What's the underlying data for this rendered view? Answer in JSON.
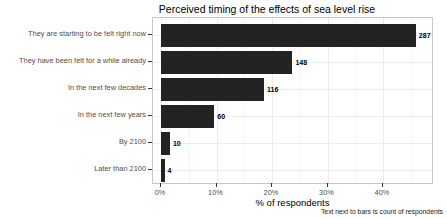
{
  "chart_data": {
    "type": "bar",
    "orientation": "horizontal",
    "title": "Perceived timing of the effects of sea level rise",
    "categories": [
      "They are starting to be felt right now",
      "They have been felt for a while already",
      "In the next few decades",
      "In the next few years",
      "By 2100",
      "Later than 2100"
    ],
    "counts": [
      287,
      148,
      116,
      60,
      10,
      4
    ],
    "values_pct": [
      45.9,
      23.7,
      18.6,
      9.6,
      1.6,
      0.6
    ],
    "total_respondents": 625,
    "xlabel": "% of respondents",
    "ylabel": "",
    "caption": "Text next to bars is count of respondents",
    "x_tick_labels": [
      "0%",
      "10%",
      "20%",
      "30%",
      "40%"
    ],
    "x_tick_values": [
      0,
      10,
      20,
      30,
      40
    ],
    "x_minor_tick_values": [
      5,
      15,
      25,
      35,
      45
    ],
    "xlim": [
      0,
      49
    ],
    "legend": "none",
    "grid": "light",
    "bar_color": "#232323",
    "panel_border_color": "#c7c7c7",
    "axis_text_color": "#4d4d4d"
  }
}
